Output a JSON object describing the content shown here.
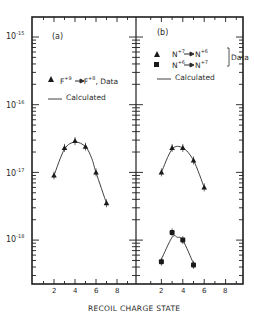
{
  "figure": {
    "xlabel": "RECOIL CHARGE STATE",
    "panel_a_label": "(a)",
    "panel_b_label": "(b)",
    "legend_a": {
      "marker": "triangle",
      "entry_ion_from": "F",
      "entry_ion_from_charge": "+9",
      "entry_ion_to": "F",
      "entry_ion_to_charge": "+8",
      "entry_suffix": ", Data",
      "line_label": "Calculated"
    },
    "legend_b": {
      "row1_from": "N",
      "row1_from_charge": "+7",
      "row1_to": "N",
      "row1_to_charge": "+6",
      "row2_from": "N",
      "row2_from_charge": "+6",
      "row2_to": "N",
      "row2_to_charge": "+7",
      "bracket_label": "Data",
      "line_label": "Calculated"
    },
    "y_tick_labels": [
      {
        "base": "10",
        "exp": "-15"
      },
      {
        "base": "10",
        "exp": "-16"
      },
      {
        "base": "10",
        "exp": "-17"
      },
      {
        "base": "10",
        "exp": "-18"
      }
    ],
    "x_tick_labels": [
      "2",
      "4",
      "6",
      "8"
    ]
  },
  "chart_data": [
    {
      "type": "scatter",
      "title": "(a)",
      "xlabel": "RECOIL CHARGE STATE",
      "ylabel": "",
      "yscale": "log",
      "ylim": [
        3e-19,
        2e-15
      ],
      "xlim": [
        0,
        10
      ],
      "x_ticks": [
        2,
        4,
        6,
        8
      ],
      "y_ticks": [
        "1e-15",
        "1e-16",
        "1e-17",
        "1e-18"
      ],
      "grid": false,
      "legend": [
        "F+9 → F+8, Data",
        "Calculated"
      ],
      "series": [
        {
          "name": "F+9 → F+8, Data",
          "marker": "triangle",
          "x": [
            2,
            3,
            4,
            5,
            6,
            7
          ],
          "y": [
            9e-18,
            2.3e-17,
            2.9e-17,
            2.4e-17,
            1e-17,
            3.5e-18
          ]
        },
        {
          "name": "Calculated",
          "style": "line",
          "x": [
            2,
            3,
            4,
            5,
            5.6,
            6,
            7
          ],
          "y": [
            9e-18,
            2.2e-17,
            2.8e-17,
            2.4e-17,
            1.6e-17,
            1e-17,
            3.5e-18
          ]
        }
      ]
    },
    {
      "type": "scatter",
      "title": "(b)",
      "xlabel": "RECOIL CHARGE STATE",
      "ylabel": "",
      "yscale": "log",
      "ylim": [
        3e-19,
        2e-15
      ],
      "xlim": [
        0,
        10
      ],
      "x_ticks": [
        2,
        4,
        6,
        8
      ],
      "y_ticks": [
        "1e-15",
        "1e-16",
        "1e-17",
        "1e-18"
      ],
      "grid": false,
      "legend": [
        "N+7 → N+6, Data",
        "N+6 → N+7, Data",
        "Calculated"
      ],
      "series": [
        {
          "name": "N+7 → N+6, Data",
          "marker": "triangle",
          "x": [
            2,
            3,
            4,
            5,
            6
          ],
          "y": [
            1e-17,
            2.3e-17,
            2.3e-17,
            1.5e-17,
            6e-18
          ]
        },
        {
          "name": "Calculated (N+7 → N+6)",
          "style": "line",
          "x": [
            2,
            3,
            4,
            5,
            6
          ],
          "y": [
            1e-17,
            2.2e-17,
            2.3e-17,
            1.5e-17,
            6e-18
          ]
        },
        {
          "name": "N+6 → N+7, Data",
          "marker": "square",
          "x": [
            2,
            3,
            4,
            5
          ],
          "y": [
            4.8e-19,
            1.3e-18,
            1e-18,
            4.3e-19
          ]
        },
        {
          "name": "Calculated (N+6 → N+7)",
          "style": "line",
          "x": [
            2,
            3,
            3.5,
            4,
            5
          ],
          "y": [
            5.2e-19,
            1.1e-18,
            1.1e-18,
            1e-18,
            4.5e-19
          ]
        }
      ]
    }
  ]
}
